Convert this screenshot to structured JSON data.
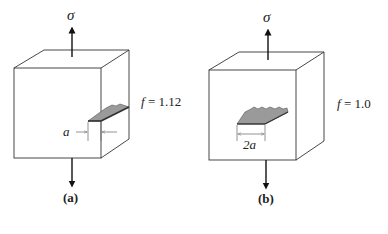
{
  "panels": [
    {
      "id": "a",
      "caption": "(a)",
      "stress_label": "σ",
      "factor_symbol": "f",
      "factor_value": "= 1.12",
      "crack_type": "edge crack",
      "dimension_label": "a"
    },
    {
      "id": "b",
      "caption": "(b)",
      "stress_label": "σ",
      "factor_symbol": "f",
      "factor_value": "= 1.0",
      "crack_type": "center (internal) crack",
      "dimension_label": "2a"
    }
  ],
  "colors": {
    "line": "#333333",
    "crack_fill": "#9a9a9a",
    "crack_edge": "#555555",
    "dim_line": "#666666"
  }
}
